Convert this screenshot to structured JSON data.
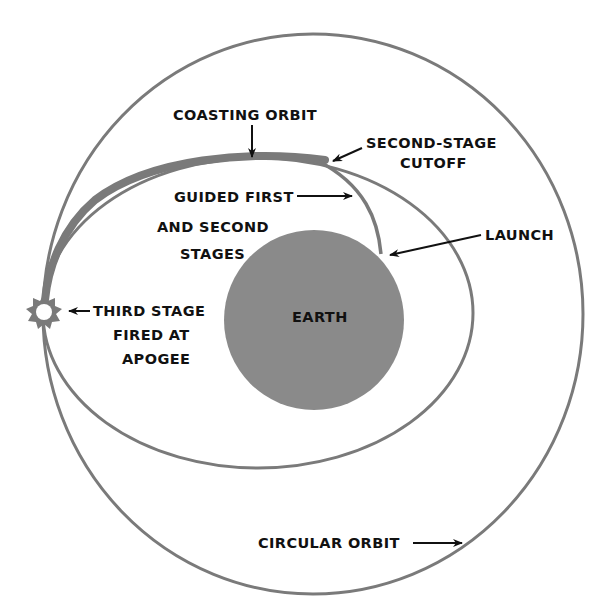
{
  "diagram": {
    "type": "orbital-trajectory",
    "colors": {
      "background": "#ffffff",
      "orbit_stroke": "#7a7a7a",
      "earth_fill": "#8a8a8a",
      "text": "#111111",
      "arrow": "#111111"
    },
    "earth": {
      "label": "EARTH",
      "cx": 314,
      "cy": 320,
      "r": 90
    },
    "circular_orbit": {
      "label": "CIRCULAR ORBIT",
      "cx": 313,
      "cy": 314,
      "rx": 270,
      "ry": 280
    },
    "transfer_orbit": {
      "cx": 258,
      "cy": 313,
      "rx": 215,
      "ry": 155
    },
    "labels": {
      "coasting_orbit": "COASTING ORBIT",
      "second_stage_cutoff": [
        "SECOND-STAGE",
        "CUTOFF"
      ],
      "guided_stages": [
        "GUIDED FIRST",
        "AND SECOND",
        "STAGES"
      ],
      "launch": "LAUNCH",
      "third_stage": [
        "THIRD STAGE",
        "FIRED AT",
        "APOGEE"
      ],
      "earth": "EARTH",
      "circular_orbit": "CIRCULAR ORBIT"
    }
  }
}
